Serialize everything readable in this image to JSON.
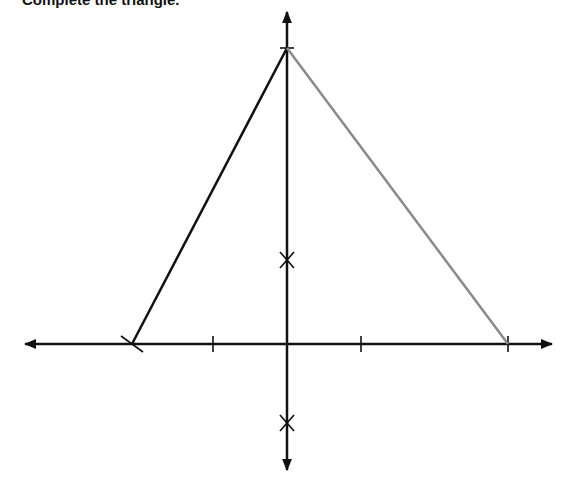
{
  "title": "Complete the triangle.",
  "colors": {
    "axis": "#111111",
    "given_side": "#111111",
    "drawn_side": "#8a8a8a",
    "background": "#ffffff"
  },
  "diagram": {
    "axes": {
      "x_axis": {
        "y": 344,
        "x_start": 25,
        "x_end": 552
      },
      "y_axis": {
        "x": 287,
        "y_start": 12,
        "y_end": 470
      }
    },
    "x_ticks": [
      213,
      361,
      508
    ],
    "slash_mark": {
      "x": 132,
      "y": 344
    },
    "apex_tick": {
      "x": 287,
      "y": 48
    },
    "cross_marks": [
      {
        "x": 287,
        "y": 260
      },
      {
        "x": 287,
        "y": 423
      }
    ],
    "triangle": {
      "apex": {
        "x": 287,
        "y": 48
      },
      "left_vertex": {
        "x": 132,
        "y": 344
      },
      "right_vertex": {
        "x": 508,
        "y": 344
      }
    }
  }
}
